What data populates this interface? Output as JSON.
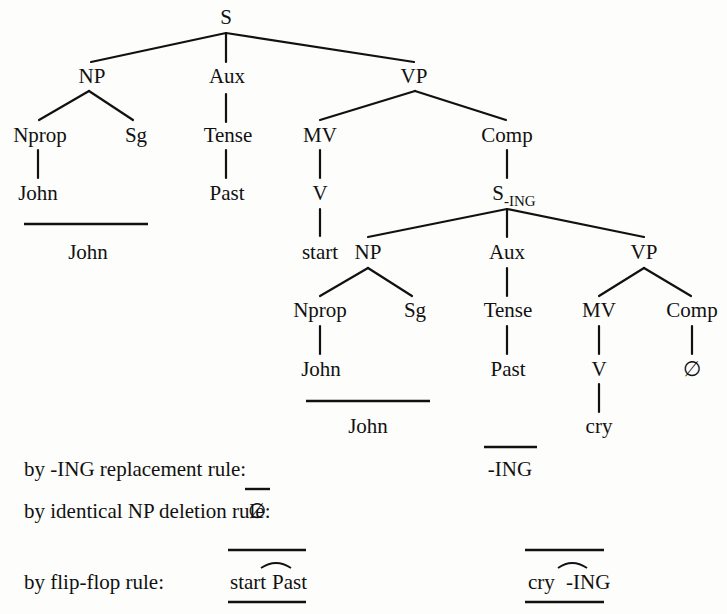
{
  "tree": {
    "root": "S",
    "level1": [
      "NP",
      "Aux",
      "VP"
    ],
    "np_children": [
      "Nprop",
      "Sg"
    ],
    "np_leaf": "John",
    "aux_child": "Tense",
    "aux_leaf": "Past",
    "vp_children": [
      "MV",
      "Comp"
    ],
    "mv_child": "V",
    "mv_leaf": "start",
    "comp_child_base": "S",
    "comp_child_sub": "-ING",
    "sub_level1": [
      "NP",
      "Aux",
      "VP"
    ],
    "sub_np_children": [
      "Nprop",
      "Sg"
    ],
    "sub_np_leaf": "John",
    "sub_aux_child": "Tense",
    "sub_aux_leaf": "Past",
    "sub_vp_children": [
      "MV",
      "Comp"
    ],
    "sub_mv_child": "V",
    "sub_mv_leaf": "cry",
    "sub_comp_leaf": "∅"
  },
  "derivation": {
    "john_summary_1": "John",
    "john_summary_2": "John",
    "rules": [
      {
        "label": "by -ING replacement rule:",
        "result": "-ING"
      },
      {
        "label": "by identical NP deletion rule:",
        "result": "∅"
      },
      {
        "label": "by flip-flop rule:",
        "result_left": [
          "start",
          "Past"
        ],
        "result_right": [
          "cry",
          "-ING"
        ]
      }
    ]
  }
}
